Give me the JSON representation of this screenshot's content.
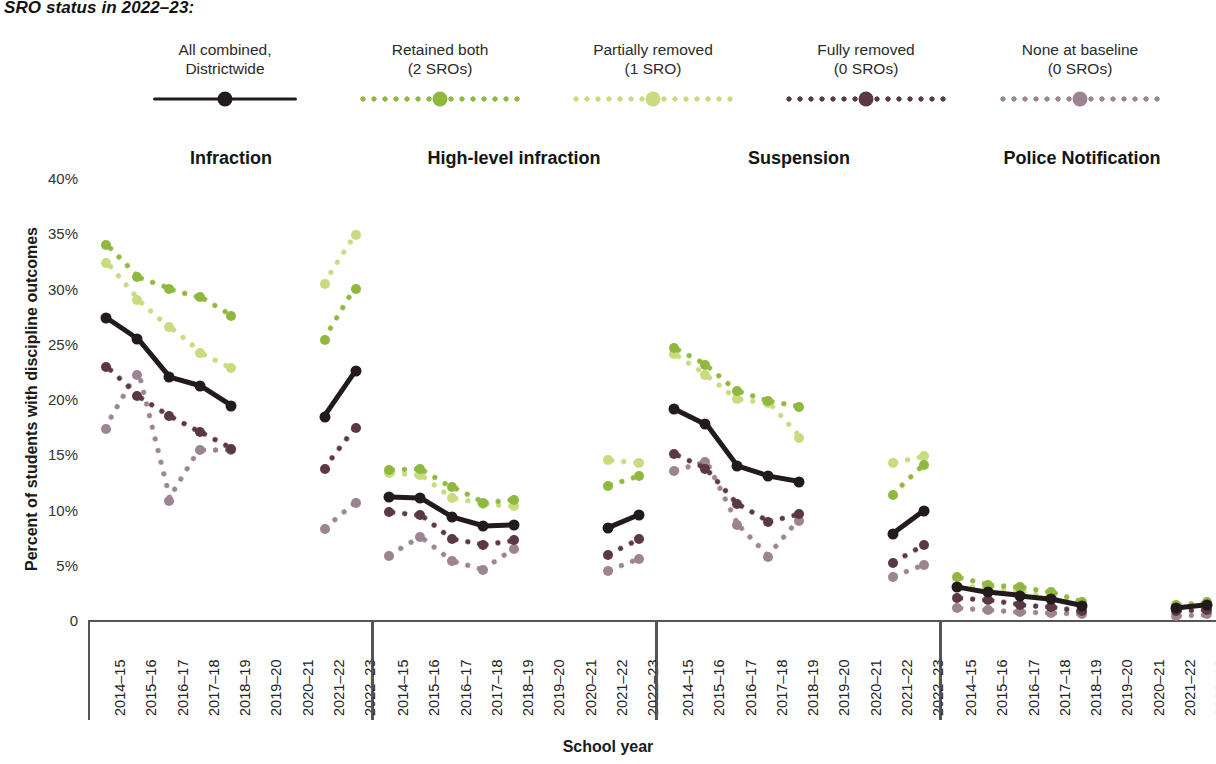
{
  "header": {
    "title": "SRO status in 2022–23:"
  },
  "legend": {
    "items": [
      {
        "label": "All combined,\nDistrictwide",
        "style": "solid",
        "color": "#231a1c",
        "name": "all-combined-districtwide"
      },
      {
        "label": "Retained both\n(2 SROs)",
        "style": "dotted",
        "color": "#8fb93e",
        "name": "retained-both"
      },
      {
        "label": "Partially removed\n(1 SRO)",
        "style": "dotted",
        "color": "#c6dc7e",
        "name": "partially-removed"
      },
      {
        "label": "Fully removed\n(0 SROs)",
        "style": "dotted",
        "color": "#5c3845",
        "name": "fully-removed"
      },
      {
        "label": "None at baseline\n(0 SROs)",
        "style": "dotted",
        "color": "#9d8493",
        "name": "none-at-baseline"
      }
    ]
  },
  "axes": {
    "ylabel": "Percent of students with discipline outcomes",
    "xlabel": "School year",
    "yticks": [
      "40%",
      "35%",
      "30%",
      "25%",
      "20%",
      "15%",
      "10%",
      "5%",
      "0"
    ],
    "ytick_values": [
      40,
      35,
      30,
      25,
      20,
      15,
      10,
      5,
      0
    ],
    "xticks": [
      "2014–15",
      "2015–16",
      "2016–17",
      "2017–18",
      "2018–19",
      "2019–20",
      "2020–21",
      "2021–22",
      "2022–23"
    ]
  },
  "chart_data": {
    "type": "line",
    "title": "SRO status in 2022–23:",
    "xlabel": "School year",
    "ylabel": "Percent of students with discipline outcomes",
    "ylim": [
      0,
      40
    ],
    "grid": false,
    "legend_position": "top",
    "x": [
      "2014–15",
      "2015–16",
      "2016–17",
      "2017–18",
      "2018–19",
      "2019–20",
      "2020–21",
      "2021–22",
      "2022–23"
    ],
    "note": "Values for 2019–20 and 2020–21 are missing (pandemic years). null = no data.",
    "panels": [
      {
        "name": "Infraction",
        "series": [
          {
            "name": "All combined, Districtwide",
            "color": "#231a1c",
            "style": "solid",
            "values": [
              27.3,
              25.4,
              22.0,
              21.2,
              19.4,
              null,
              null,
              18.4,
              22.5
            ]
          },
          {
            "name": "Retained both (2 SROs)",
            "color": "#8fb93e",
            "style": "dotted",
            "values": [
              33.9,
              31.0,
              30.0,
              29.2,
              27.5,
              null,
              null,
              25.3,
              30.0
            ]
          },
          {
            "name": "Partially removed (1 SRO)",
            "color": "#c6dc7e",
            "style": "dotted",
            "values": [
              32.3,
              29.0,
              26.5,
              24.2,
              22.8,
              null,
              null,
              30.4,
              34.8
            ]
          },
          {
            "name": "Fully removed (0 SROs)",
            "color": "#5c3845",
            "style": "dotted",
            "values": [
              22.9,
              20.3,
              18.5,
              17.0,
              15.5,
              null,
              null,
              13.7,
              17.4
            ]
          },
          {
            "name": "None at baseline (0 SROs)",
            "color": "#9d8493",
            "style": "dotted",
            "values": [
              17.3,
              22.2,
              10.8,
              15.4,
              15.4,
              null,
              null,
              8.2,
              10.6
            ]
          }
        ]
      },
      {
        "name": "High-level infraction",
        "series": [
          {
            "name": "All combined, Districtwide",
            "color": "#231a1c",
            "style": "solid",
            "values": [
              11.1,
              11.0,
              9.3,
              8.5,
              8.6,
              null,
              null,
              8.3,
              9.5
            ]
          },
          {
            "name": "Retained both (2 SROs)",
            "color": "#8fb93e",
            "style": "dotted",
            "values": [
              13.6,
              13.7,
              12.0,
              10.6,
              10.9,
              null,
              null,
              12.1,
              13.0
            ]
          },
          {
            "name": "Partially removed (1 SRO)",
            "color": "#c6dc7e",
            "style": "dotted",
            "values": [
              13.3,
              13.1,
              11.0,
              10.5,
              10.3,
              null,
              null,
              14.5,
              14.2
            ]
          },
          {
            "name": "Fully removed (0 SROs)",
            "color": "#5c3845",
            "style": "dotted",
            "values": [
              9.8,
              9.5,
              7.3,
              6.8,
              7.2,
              null,
              null,
              5.9,
              7.3
            ]
          },
          {
            "name": "None at baseline (0 SROs)",
            "color": "#9d8493",
            "style": "dotted",
            "values": [
              5.8,
              7.5,
              5.3,
              4.5,
              6.4,
              null,
              null,
              4.4,
              5.5
            ]
          }
        ]
      },
      {
        "name": "Suspension",
        "series": [
          {
            "name": "All combined, Districtwide",
            "color": "#231a1c",
            "style": "solid",
            "values": [
              19.1,
              17.7,
              13.9,
              13.0,
              12.5,
              null,
              null,
              7.8,
              9.9
            ]
          },
          {
            "name": "Retained both (2 SROs)",
            "color": "#8fb93e",
            "style": "dotted",
            "values": [
              24.6,
              23.1,
              20.7,
              19.8,
              19.3,
              null,
              null,
              11.3,
              14.0
            ]
          },
          {
            "name": "Partially removed (1 SRO)",
            "color": "#c6dc7e",
            "style": "dotted",
            "values": [
              24.1,
              22.2,
              20.0,
              19.6,
              16.5,
              null,
              null,
              14.2,
              14.8
            ]
          },
          {
            "name": "Fully removed (0 SROs)",
            "color": "#5c3845",
            "style": "dotted",
            "values": [
              15.0,
              13.7,
              10.5,
              8.9,
              9.6,
              null,
              null,
              5.2,
              6.8
            ]
          },
          {
            "name": "None at baseline (0 SROs)",
            "color": "#9d8493",
            "style": "dotted",
            "values": [
              13.5,
              14.3,
              8.6,
              5.7,
              9.0,
              null,
              null,
              3.9,
              5.0
            ]
          }
        ]
      },
      {
        "name": "Police Notification",
        "series": [
          {
            "name": "All combined, Districtwide",
            "color": "#231a1c",
            "style": "solid",
            "values": [
              3.0,
              2.5,
              2.2,
              1.9,
              1.3,
              null,
              null,
              1.1,
              1.4
            ]
          },
          {
            "name": "Retained both (2 SROs)",
            "color": "#8fb93e",
            "style": "dotted",
            "values": [
              3.9,
              3.2,
              3.0,
              2.5,
              1.6,
              null,
              null,
              1.4,
              1.6
            ]
          },
          {
            "name": "Partially removed (1 SRO)",
            "color": "#c6dc7e",
            "style": "dotted",
            "values": [
              3.0,
              3.0,
              2.6,
              2.0,
              1.5,
              null,
              null,
              1.3,
              1.5
            ]
          },
          {
            "name": "Fully removed (0 SROs)",
            "color": "#5c3845",
            "style": "dotted",
            "values": [
              2.0,
              1.8,
              1.4,
              1.2,
              0.8,
              null,
              null,
              0.8,
              0.9
            ]
          },
          {
            "name": "None at baseline (0 SROs)",
            "color": "#9d8493",
            "style": "dotted",
            "values": [
              1.1,
              0.9,
              0.7,
              0.6,
              0.5,
              null,
              null,
              0.4,
              0.5
            ]
          }
        ]
      }
    ]
  }
}
